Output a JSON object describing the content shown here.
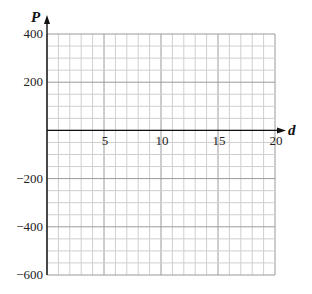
{
  "chart_data": {
    "type": "line",
    "title": "",
    "xlabel": "d",
    "ylabel": "P",
    "xlim": [
      0,
      20
    ],
    "ylim": [
      -600,
      400
    ],
    "x_ticks": [
      5,
      10,
      15,
      20
    ],
    "x_tick_labels": [
      "5",
      "10",
      "15",
      "20"
    ],
    "y_ticks": [
      400,
      200,
      -200,
      -400,
      -600
    ],
    "y_tick_labels": [
      "400",
      "200",
      "−200",
      "−400",
      "−600"
    ],
    "grid": true,
    "grid_minor_x_step": 1,
    "grid_minor_y_step": 50,
    "grid_major_x_step": 5,
    "grid_major_y_step": 200,
    "series": [],
    "legend": null
  },
  "colors": {
    "minor_grid": "#cfcfcf",
    "major_grid": "#9a9a9a",
    "axis": "#111111"
  }
}
